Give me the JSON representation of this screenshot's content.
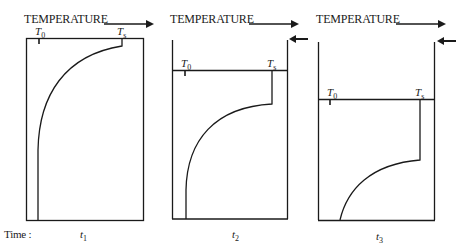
{
  "axis_label": "TEMPERATURE",
  "time_label": "Time :",
  "panels": [
    {
      "time": "t",
      "time_sub": "1",
      "t0_label": "T",
      "t0_sub": "0",
      "ts_label": "T",
      "ts_sub": "s"
    },
    {
      "time": "t",
      "time_sub": "2",
      "t0_label": "T",
      "t0_sub": "0",
      "ts_label": "T",
      "ts_sub": "s"
    },
    {
      "time": "t",
      "time_sub": "3",
      "t0_label": "T",
      "t0_sub": "0",
      "ts_label": "T",
      "ts_sub": "s"
    }
  ],
  "colors": {
    "line": "#1a1a1a",
    "background": "#ffffff"
  }
}
